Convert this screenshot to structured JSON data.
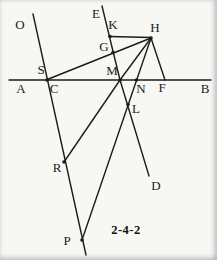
{
  "figure": {
    "caption": "2-4-2",
    "caption_pos": {
      "x": 126,
      "y": 230
    },
    "background": "#f7f7f4",
    "line_color": "#1c1c1c",
    "line_width": 1.4,
    "dot_radius": 1.8,
    "canvas": {
      "width": 217,
      "height": 260
    },
    "points": [
      {
        "id": "O",
        "label": "O",
        "label_x": 20,
        "label_y": 24,
        "dot": false
      },
      {
        "id": "E",
        "label": "E",
        "label_x": 96,
        "label_y": 13,
        "dot": false
      },
      {
        "id": "K",
        "label": "K",
        "label_x": 113,
        "label_y": 24,
        "dot": true,
        "x": 110,
        "y": 36.5
      },
      {
        "id": "H",
        "label": "H",
        "label_x": 155,
        "label_y": 27,
        "dot": true,
        "x": 151,
        "y": 38
      },
      {
        "id": "G",
        "label": "G",
        "label_x": 104,
        "label_y": 46,
        "dot": true,
        "x": 113,
        "y": 52.5
      },
      {
        "id": "S",
        "label": "S",
        "label_x": 41,
        "label_y": 69,
        "dot": true,
        "x": 47,
        "y": 80
      },
      {
        "id": "M",
        "label": "M",
        "label_x": 112,
        "label_y": 70,
        "dot": true,
        "x": 120,
        "y": 80
      },
      {
        "id": "A",
        "label": "A",
        "label_x": 21,
        "label_y": 88,
        "dot": false
      },
      {
        "id": "C",
        "label": "C",
        "label_x": 54,
        "label_y": 88,
        "dot": false
      },
      {
        "id": "N",
        "label": "N",
        "label_x": 141,
        "label_y": 88,
        "dot": true,
        "x": 136.5,
        "y": 80
      },
      {
        "id": "F",
        "label": "F",
        "label_x": 162,
        "label_y": 87,
        "dot": false,
        "x": 165,
        "y": 80
      },
      {
        "id": "B",
        "label": "B",
        "label_x": 205,
        "label_y": 88,
        "dot": false
      },
      {
        "id": "L",
        "label": "L",
        "label_x": 136,
        "label_y": 108,
        "dot": true,
        "x": 128,
        "y": 104.5
      },
      {
        "id": "R",
        "label": "R",
        "label_x": 57,
        "label_y": 167,
        "dot": true,
        "x": 64,
        "y": 162
      },
      {
        "id": "D",
        "label": "D",
        "label_x": 156,
        "label_y": 185,
        "dot": false
      },
      {
        "id": "P",
        "label": "P",
        "label_x": 67,
        "label_y": 240,
        "dot": true,
        "x": 82,
        "y": 240
      }
    ],
    "segments": [
      {
        "name": "line-AB",
        "x1": 9,
        "y1": 80,
        "x2": 211,
        "y2": 80
      },
      {
        "name": "line-O-S-R-P",
        "x1": 33,
        "y1": 14,
        "x2": 86,
        "y2": 255
      },
      {
        "name": "line-E-M",
        "x1": 102,
        "y1": 6,
        "x2": 120,
        "y2": 80
      },
      {
        "name": "line-M-D",
        "x1": 120,
        "y1": 80,
        "x2": 149,
        "y2": 176
      },
      {
        "name": "line-S-G-H",
        "x1": 46,
        "y1": 80,
        "x2": 151,
        "y2": 38
      },
      {
        "name": "line-K-H",
        "x1": 109,
        "y1": 36.5,
        "x2": 151,
        "y2": 37.5
      },
      {
        "name": "line-H-M",
        "x1": 151,
        "y1": 38,
        "x2": 120,
        "y2": 80
      },
      {
        "name": "line-M-R",
        "x1": 120,
        "y1": 80,
        "x2": 64,
        "y2": 162
      },
      {
        "name": "line-H-N-L-P",
        "x1": 151,
        "y1": 38,
        "x2": 82,
        "y2": 240
      },
      {
        "name": "line-H-F",
        "x1": 151,
        "y1": 38,
        "x2": 165,
        "y2": 80
      }
    ]
  }
}
